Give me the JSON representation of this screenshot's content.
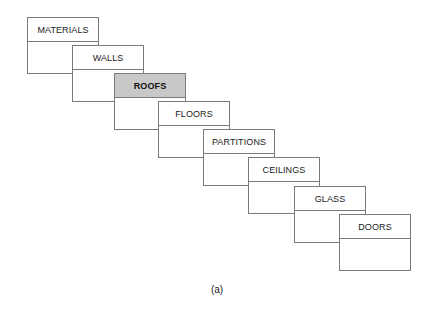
{
  "diagram": {
    "type": "cascading-stacked-cards",
    "cards": [
      {
        "label": "MATERIALS",
        "selected": false
      },
      {
        "label": "WALLS",
        "selected": false
      },
      {
        "label": "ROOFS",
        "selected": true
      },
      {
        "label": "FLOORS",
        "selected": false
      },
      {
        "label": "PARTITIONS",
        "selected": false
      },
      {
        "label": "CEILINGS",
        "selected": false
      },
      {
        "label": "GLASS",
        "selected": false
      },
      {
        "label": "DOORS",
        "selected": false
      }
    ],
    "caption": "(a)",
    "colors": {
      "border": "#7a7a7a",
      "selected_fill": "#c8c8c8",
      "text": "#1a1a1a",
      "background": "#ffffff"
    }
  }
}
